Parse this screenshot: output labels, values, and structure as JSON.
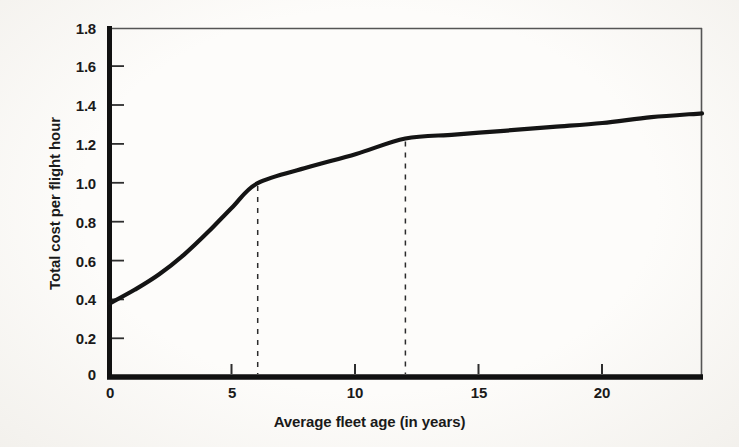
{
  "chart_data": {
    "type": "line",
    "title": "",
    "subtitle": "",
    "xlabel": "Average fleet age (in years)",
    "ylabel": "Total cost per flight hour",
    "xlim": [
      0,
      24.05
    ],
    "ylim": [
      0,
      1.8
    ],
    "grid": false,
    "legend": "none",
    "x_ticks": [
      0,
      5,
      10,
      15,
      20
    ],
    "x_tick_labels": [
      "0",
      "5",
      "10",
      "15",
      "20"
    ],
    "y_ticks": [
      0,
      0.2,
      0.4,
      0.6,
      0.8,
      1.0,
      1.2,
      1.4,
      1.6,
      1.8
    ],
    "y_tick_labels": [
      "0",
      "0.2",
      "0.4",
      "0.6",
      "0.8",
      "1.0",
      "1.2",
      "1.4",
      "1.6",
      "1.8"
    ],
    "series": [
      {
        "name": "Total cost per flight hour",
        "color": "#141414",
        "x": [
          0,
          1,
          2,
          3,
          4,
          5,
          6,
          8,
          10,
          12,
          14,
          16,
          18,
          20,
          22,
          24.05
        ],
        "values": [
          0.38,
          0.45,
          0.53,
          0.63,
          0.75,
          0.88,
          1.0,
          1.08,
          1.15,
          1.23,
          1.25,
          1.27,
          1.29,
          1.31,
          1.34,
          1.36
        ]
      }
    ],
    "annotations": [
      {
        "type": "vertical-dashed-line",
        "name": "guide-line-6-years",
        "x": 6.0,
        "y_from": 0,
        "y_to": 1.0,
        "color": "#2b2b2b"
      },
      {
        "type": "vertical-dashed-line",
        "name": "guide-line-12-years",
        "x": 12.0,
        "y_from": 0,
        "y_to": 1.23,
        "color": "#2b2b2b"
      }
    ]
  },
  "axes": {
    "x_title": "Average fleet age (in years)",
    "y_title": "Total cost per flight hour"
  },
  "colors": {
    "curve": "#141414",
    "axis": "#111111",
    "frame": "#4d4d4d",
    "dashed_guide": "#2b2b2b",
    "text": "#1a1a1a",
    "background": "#fdfcfa"
  }
}
